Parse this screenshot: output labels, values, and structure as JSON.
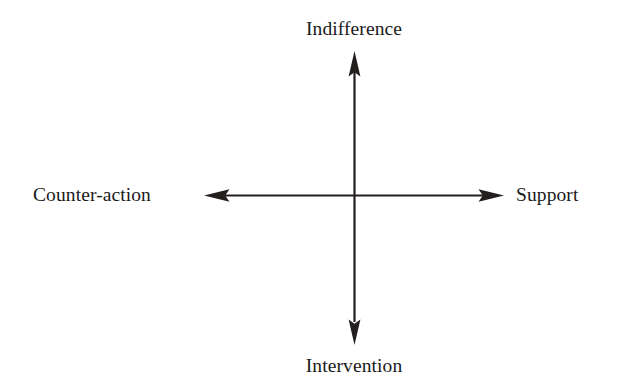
{
  "diagram": {
    "background_color": "#ffffff",
    "line_color": "#231f1e",
    "text_color": "#1a1a1a",
    "axes": [
      {
        "name": "vertical-axis",
        "orientation": "vertical",
        "positive_end_label": "Indifference",
        "negative_end_label": "Intervention"
      },
      {
        "name": "horizontal-axis",
        "orientation": "horizontal",
        "positive_end_label": "Support",
        "negative_end_label": "Counter-action"
      }
    ],
    "labels": {
      "top": "Indifference",
      "left": "Counter-action",
      "right": "Support",
      "bottom": "Intervention"
    },
    "arrowheads": {
      "top": "arrow-up-icon",
      "bottom": "arrow-down-icon",
      "left": "arrow-left-icon",
      "right": "arrow-right-icon"
    },
    "geometry": {
      "origin_x": 354,
      "origin_y": 195,
      "top_tip_y": 52,
      "bottom_tip_y": 345,
      "left_tip_x": 205,
      "right_tip_x": 503
    }
  }
}
